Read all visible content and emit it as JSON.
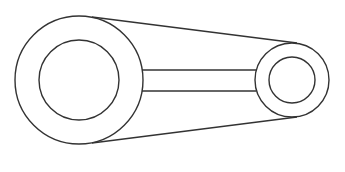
{
  "diagram": {
    "type": "belt-pulley-linkage",
    "stroke_color": "#333333",
    "background": "#ffffff",
    "large_pulley": {
      "cx": 79,
      "cy": 80,
      "outer_r": 64,
      "inner_r": 40
    },
    "small_pulley": {
      "cx": 292,
      "cy": 80,
      "outer_r": 37,
      "inner_r": 23
    },
    "belt": {
      "top": {
        "x1": 92,
        "y1": 17,
        "x2": 297,
        "y2": 43
      },
      "bottom": {
        "x1": 92,
        "y1": 143,
        "x2": 297,
        "y2": 117
      }
    },
    "link_bar": {
      "x1": 142,
      "x2": 256,
      "y_top": 70,
      "y_bottom": 91
    }
  }
}
